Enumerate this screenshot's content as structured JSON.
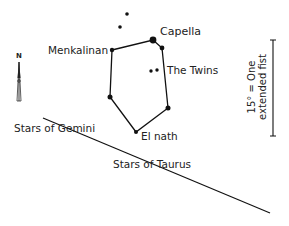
{
  "diagram": {
    "type": "star-chart",
    "constellation": "Auriga",
    "labels": {
      "capella": "Capella",
      "menkalinan": "Menkalinan",
      "twins": "The Twins",
      "elnath": "El nath",
      "gemini": "Stars of Gemini",
      "taurus": "Stars of Taurus"
    },
    "scale": {
      "line1": "15° = One",
      "line2": "extended fist"
    },
    "compass": {
      "north_label": "N"
    },
    "colors": {
      "ink": "#111111",
      "background": "#ffffff"
    }
  }
}
